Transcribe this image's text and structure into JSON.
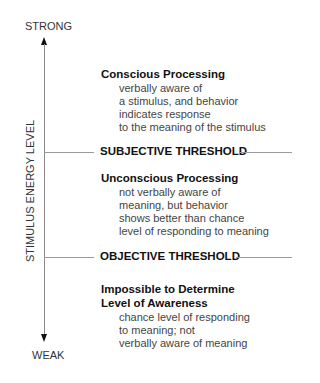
{
  "axis": {
    "top_label": "STRONG",
    "bottom_label": "WEAK",
    "vertical_label": "STIMULUS ENERGY LEVEL"
  },
  "thresholds": [
    {
      "label": "SUBJECTIVE THRESHOLD"
    },
    {
      "label": "OBJECTIVE THRESHOLD"
    }
  ],
  "regions": [
    {
      "title_lines": [
        "Conscious Processing"
      ],
      "description_lines": [
        "verbally aware of",
        "a stimulus, and behavior",
        "indicates response",
        "to the meaning of the stimulus"
      ]
    },
    {
      "title_lines": [
        "Unconscious Processing"
      ],
      "description_lines": [
        "not verbally aware of",
        "meaning, but behavior",
        "shows better than chance",
        "level of responding to meaning"
      ]
    },
    {
      "title_lines": [
        "Impossible to Determine",
        "Level of Awareness"
      ],
      "description_lines": [
        "chance level of responding",
        "to meaning; not",
        "verbally aware of meaning"
      ]
    }
  ],
  "colors": {
    "text": "#1a1a1a",
    "description": "#444444",
    "lines": "#9a9a9a",
    "arrow": "#111111"
  }
}
